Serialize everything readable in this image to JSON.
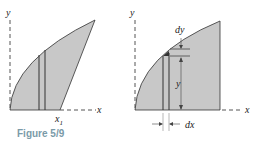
{
  "figure": {
    "caption": "Figure 5/9",
    "left_panel": {
      "axis_x_label": "x",
      "axis_y_label": "y",
      "point_label": "x",
      "point_subscript": "1"
    },
    "right_panel": {
      "axis_x_label": "x",
      "axis_y_label": "y",
      "height_label": "y",
      "dy_label": "dy",
      "dx_label": "dx"
    },
    "colors": {
      "fill": "#c8c8c8",
      "stroke": "#333333",
      "caption": "#7a9aa8"
    }
  }
}
